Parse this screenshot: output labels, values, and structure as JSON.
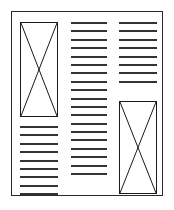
{
  "diagram": {
    "page": {
      "border_color": "#2b2b2b",
      "background_color": "#ffffff",
      "orientation": "portrait"
    },
    "ink_color": "#333333",
    "placeholder_color": "#1a1a1a",
    "columns": [
      {
        "id": "left",
        "name": "left-column",
        "blocks": [
          {
            "kind": "image-placeholder",
            "label": "image placeholder",
            "position": "top",
            "cross": "diagonal-x"
          },
          {
            "kind": "text-lines",
            "label": "body text",
            "position": "below-image",
            "line_count": 9
          }
        ]
      },
      {
        "id": "middle",
        "name": "middle-column",
        "blocks": [
          {
            "kind": "text-lines",
            "label": "body text",
            "position": "full-height",
            "line_count": 19
          }
        ]
      },
      {
        "id": "right",
        "name": "right-column",
        "blocks": [
          {
            "kind": "text-lines",
            "label": "body text",
            "position": "top",
            "line_count": 8
          },
          {
            "kind": "image-placeholder",
            "label": "image placeholder",
            "position": "bottom",
            "cross": "diagonal-x"
          }
        ]
      }
    ]
  }
}
